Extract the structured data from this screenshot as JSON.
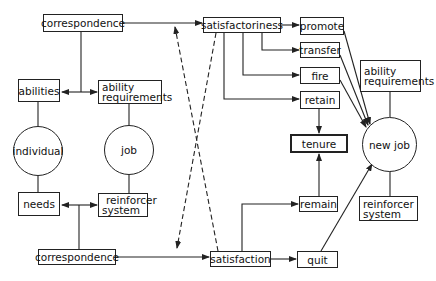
{
  "diagram": {
    "title": "",
    "top_row": {
      "correspondence": "correspondence",
      "satisfactoriness": "satisfactoriness"
    },
    "outcomes_employer": {
      "promote": "promote",
      "transfer": "transfer",
      "fire": "fire",
      "retain": "retain"
    },
    "tenure": "tenure",
    "individual": {
      "circle": "individual",
      "abilities": "abilities",
      "needs": "needs"
    },
    "job": {
      "circle": "job",
      "ability_requirements_line1": "ability",
      "ability_requirements_line2": "requirements",
      "reinforcer_system_line1": "reinforcer",
      "reinforcer_system_line2": "system"
    },
    "new_job": {
      "circle": "new job",
      "ability_requirements_line1": "ability",
      "ability_requirements_line2": "requirements",
      "reinforcer_system_line1": "reinforcer",
      "reinforcer_system_line2": "system"
    },
    "bottom_row": {
      "correspondence": "correspondence",
      "satisfaction": "satisfaction"
    },
    "outcomes_individual": {
      "remain": "remain",
      "quit": "quit"
    },
    "colors": {
      "line": "#222222",
      "background": "#ffffff"
    }
  }
}
